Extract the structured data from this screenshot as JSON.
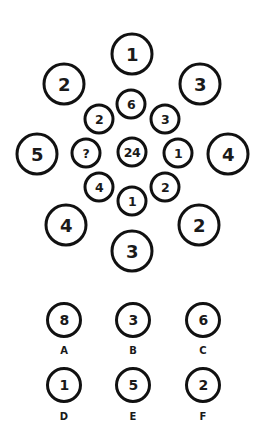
{
  "puzzle": {
    "outer_ring": [
      {
        "value": "1",
        "x": 132,
        "y": 54
      },
      {
        "value": "3",
        "x": 200,
        "y": 84
      },
      {
        "value": "4",
        "x": 228,
        "y": 154
      },
      {
        "value": "2",
        "x": 199,
        "y": 225
      },
      {
        "value": "3",
        "x": 132,
        "y": 251
      },
      {
        "value": "4",
        "x": 66,
        "y": 225
      },
      {
        "value": "5",
        "x": 37,
        "y": 154
      },
      {
        "value": "2",
        "x": 64,
        "y": 84
      }
    ],
    "inner_ring": [
      {
        "value": "6",
        "x": 131,
        "y": 104
      },
      {
        "value": "3",
        "x": 165,
        "y": 119
      },
      {
        "value": "1",
        "x": 178,
        "y": 153
      },
      {
        "value": "2",
        "x": 165,
        "y": 187
      },
      {
        "value": "1",
        "x": 132,
        "y": 201
      },
      {
        "value": "4",
        "x": 99,
        "y": 187
      },
      {
        "value": "?",
        "x": 86,
        "y": 153
      },
      {
        "value": "2",
        "x": 99,
        "y": 119
      }
    ],
    "center": {
      "value": "24",
      "x": 132,
      "y": 152
    }
  },
  "options": [
    {
      "label": "A",
      "value": "8",
      "x": 64,
      "y": 320
    },
    {
      "label": "B",
      "value": "3",
      "x": 133,
      "y": 320
    },
    {
      "label": "C",
      "value": "6",
      "x": 203,
      "y": 320
    },
    {
      "label": "D",
      "value": "1",
      "x": 64,
      "y": 385
    },
    {
      "label": "E",
      "value": "5",
      "x": 133,
      "y": 385
    },
    {
      "label": "F",
      "value": "2",
      "x": 203,
      "y": 385
    }
  ],
  "colors": {
    "stroke": "#111111",
    "text": "#1a1a1a",
    "background": "#ffffff"
  }
}
